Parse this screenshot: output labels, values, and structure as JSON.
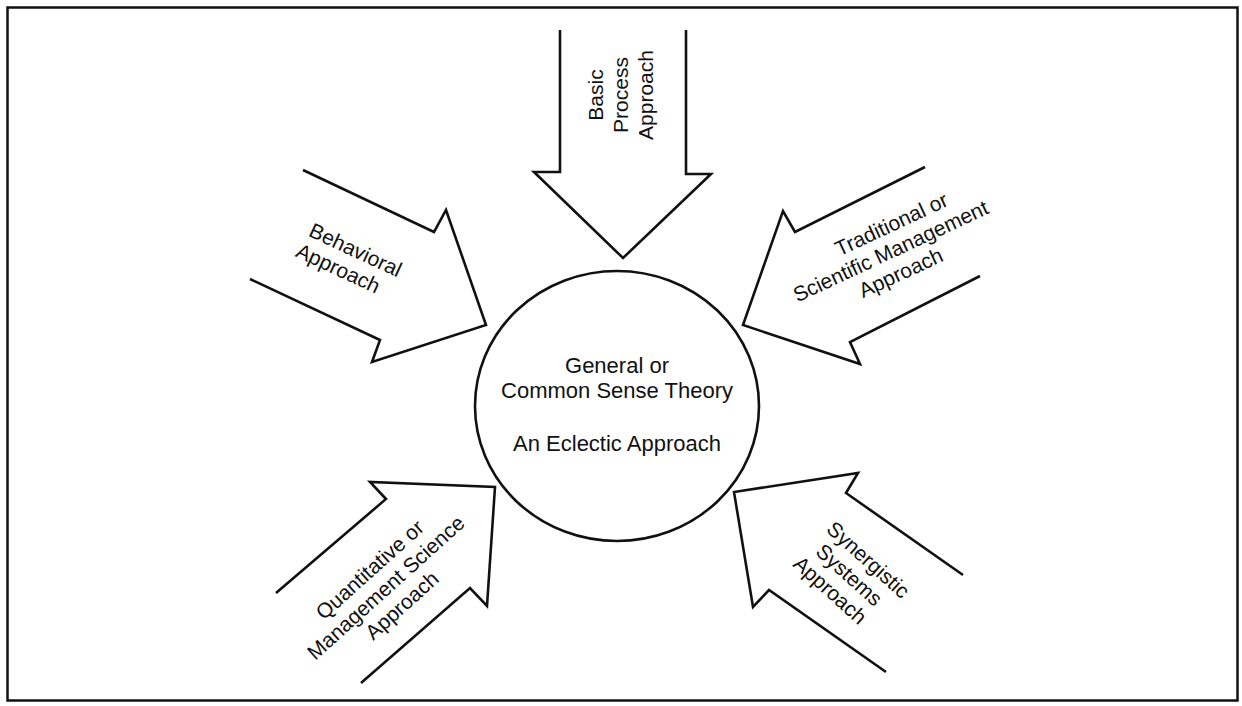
{
  "diagram": {
    "center": {
      "lines": [
        "General or",
        "Common Sense Theory"
      ],
      "subtitle": "An Eclectic Approach"
    },
    "arrows": [
      {
        "id": "basic-process",
        "position": "top",
        "lines": [
          "Basic",
          "Process",
          "Approach"
        ]
      },
      {
        "id": "behavioral",
        "position": "upper-left",
        "lines": [
          "Behavioral",
          "Approach"
        ]
      },
      {
        "id": "traditional",
        "position": "upper-right",
        "lines": [
          "Traditional or",
          "Scientific Management",
          "Approach"
        ]
      },
      {
        "id": "quantitative",
        "position": "lower-left",
        "lines": [
          "Quantitative or",
          "Management Science",
          "Approach"
        ]
      },
      {
        "id": "synergistic",
        "position": "lower-right",
        "lines": [
          "Synergistic",
          "Systems",
          "Approach"
        ]
      }
    ],
    "colors": {
      "stroke": "#111111",
      "background": "#ffffff"
    }
  }
}
